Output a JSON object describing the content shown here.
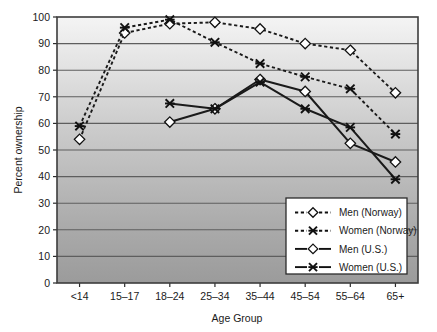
{
  "chart_data": {
    "type": "line",
    "title": "",
    "subtitle": "",
    "xlabel": "Age Group",
    "ylabel": "Percent ownership",
    "categories": [
      "<14",
      "15–17",
      "18–24",
      "25–34",
      "35–44",
      "45–54",
      "55–64",
      "65+"
    ],
    "ylim": [
      0,
      100
    ],
    "yticks": [
      0,
      10,
      20,
      30,
      40,
      50,
      60,
      70,
      80,
      90,
      100
    ],
    "ytick_labels": [
      "0",
      "10",
      "20",
      "30",
      "40",
      "50",
      "60",
      "70",
      "80",
      "90",
      "100"
    ],
    "grid": "horizontal",
    "legend_position": "lower-right",
    "background": "vertical gray gradient, light at top, dark at bottom",
    "series": [
      {
        "name": "Men (Norway)",
        "marker": "diamond-open",
        "line_style": "dashed",
        "color": "#1a1a1a",
        "x": [
          "<14",
          "15–17",
          "18–24",
          "25–34",
          "35–44",
          "45–54",
          "55–64",
          "65+"
        ],
        "values": [
          54,
          94,
          97.5,
          98,
          95.5,
          90,
          87.5,
          71.5
        ]
      },
      {
        "name": "Women (Norway)",
        "marker": "x-star",
        "line_style": "dashed",
        "color": "#1a1a1a",
        "x": [
          "<14",
          "15–17",
          "18–24",
          "25–34",
          "35–44",
          "45–54",
          "55–64",
          "65+"
        ],
        "values": [
          59,
          96,
          99,
          90.5,
          82.5,
          77.5,
          73,
          56
        ]
      },
      {
        "name": "Men (U.S.)",
        "marker": "diamond-open",
        "line_style": "solid",
        "color": "#1a1a1a",
        "x": [
          "18–24",
          "25–34",
          "35–44",
          "45–54",
          "55–64",
          "65+"
        ],
        "values": [
          60.5,
          65.5,
          76.5,
          72,
          52.5,
          45.5
        ]
      },
      {
        "name": "Women (U.S.)",
        "marker": "x-star",
        "line_style": "solid",
        "color": "#1a1a1a",
        "x": [
          "18–24",
          "25–34",
          "35–44",
          "45–54",
          "55–64",
          "65+"
        ],
        "values": [
          67.5,
          65.5,
          75.5,
          65.5,
          58.5,
          39
        ]
      }
    ]
  },
  "axes": {
    "y_title": "Percent ownership",
    "x_title": "Age Group",
    "y_labels": [
      "100",
      "90",
      "80",
      "70",
      "60",
      "50",
      "40",
      "30",
      "20",
      "10",
      "0"
    ],
    "x_labels": [
      "<14",
      "15–17",
      "18–24",
      "25–34",
      "35–44",
      "45–54",
      "55–64",
      "65+"
    ]
  },
  "legend": {
    "items": [
      {
        "label": "Men (Norway)",
        "marker": "diamond-open",
        "style": "dashed"
      },
      {
        "label": "Women (Norway)",
        "marker": "x-star",
        "style": "dashed"
      },
      {
        "label": "Men (U.S.)",
        "marker": "diamond-open",
        "style": "solid"
      },
      {
        "label": "Women (U.S.)",
        "marker": "x-star",
        "style": "solid"
      }
    ]
  },
  "colors": {
    "line": "#1a1a1a",
    "grid": "#5e5e5e",
    "frame": "#3c3c3c",
    "plot_bg_top": "#f2f2f2",
    "plot_bg_bottom": "#9a9a9a",
    "legend_bg": "#ffffff",
    "text": "#1a1a1a"
  }
}
